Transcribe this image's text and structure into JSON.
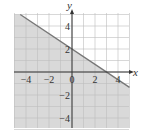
{
  "chart_data": {
    "type": "line",
    "title": "",
    "xlabel": "x",
    "ylabel": "y",
    "xlim": [
      -5,
      5
    ],
    "ylim": [
      -5,
      5
    ],
    "grid": true,
    "grid_step": 1,
    "x_ticks": [
      -4,
      -2,
      0,
      2,
      4
    ],
    "x_tick_labels": [
      "−4",
      "−2",
      "0",
      "2",
      "4"
    ],
    "y_ticks": [
      4,
      2,
      -2,
      -4
    ],
    "y_tick_labels": [
      "4",
      "2",
      "−2",
      "−4"
    ],
    "series": [
      {
        "name": "boundary line",
        "equation": "2x + 3y = 6",
        "points": [
          [
            -4.5,
            5
          ],
          [
            0,
            2
          ],
          [
            3,
            0
          ],
          [
            5,
            -1.33
          ]
        ]
      }
    ],
    "shaded_region": "below line (2x + 3y ≤ 6)",
    "intercepts": {
      "y": 2,
      "x": 3
    }
  },
  "colors": {
    "shade": "#d9d9d9",
    "grid": "#bdbdbd",
    "axis": "#333333",
    "line": "#777777",
    "background": "#ffffff"
  },
  "labels": {
    "x_axis": "x",
    "y_axis": "y"
  }
}
